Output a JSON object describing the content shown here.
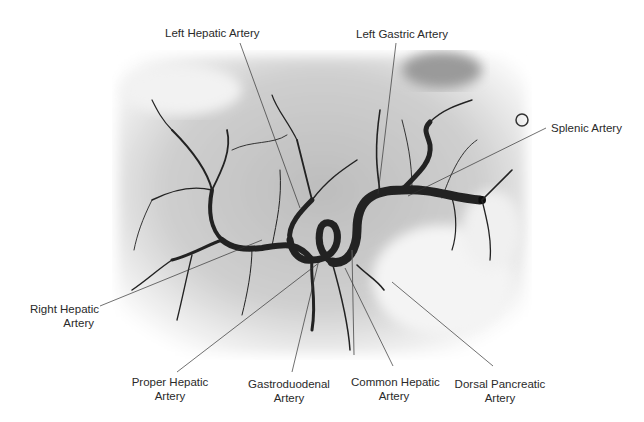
{
  "figure": {
    "type": "angiogram",
    "colors": {
      "background": "#ffffff",
      "film": "#d8d8d8",
      "vessel": "#1a1a1a",
      "leader": "#333333"
    }
  },
  "labels": [
    {
      "id": "left-hepatic-artery",
      "line1": "Left Hepatic Artery",
      "line2": ""
    },
    {
      "id": "left-gastric-artery",
      "line1": "Left Gastric Artery",
      "line2": ""
    },
    {
      "id": "splenic-artery",
      "line1": "Splenic Artery",
      "line2": ""
    },
    {
      "id": "right-hepatic-artery",
      "line1": "Right Hepatic",
      "line2": "Artery"
    },
    {
      "id": "proper-hepatic-artery",
      "line1": "Proper Hepatic",
      "line2": "Artery"
    },
    {
      "id": "gastroduodenal-artery",
      "line1": "Gastroduodenal",
      "line2": "Artery"
    },
    {
      "id": "common-hepatic-artery",
      "line1": "Common Hepatic",
      "line2": "Artery"
    },
    {
      "id": "dorsal-pancreatic-artery",
      "line1": "Dorsal Pancreatic",
      "line2": "Artery"
    }
  ]
}
